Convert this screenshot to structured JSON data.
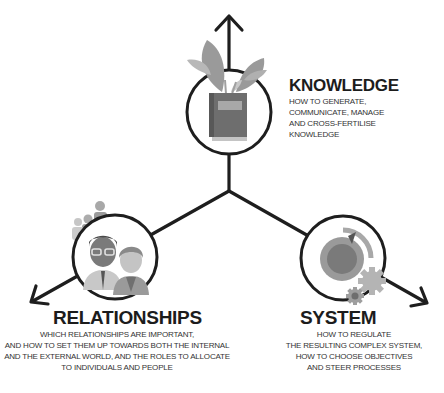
{
  "colors": {
    "line": "#1e1e1e",
    "leaf": "#9a9a9a",
    "book": "#6e6e6e",
    "people_dark": "#6a6a6a",
    "people_light": "#b4b4b4",
    "dial": "#7a7a7a",
    "gear": "#b0b0b0"
  },
  "nodes": [
    {
      "id": "knowledge",
      "icon": "book-with-plant-icon",
      "title": "KNOWLEDGE",
      "description": [
        "HOW TO GENERATE,",
        "COMMUNICATE, MANAGE",
        "AND CROSS-FERTILISE",
        "KNOWLEDGE"
      ]
    },
    {
      "id": "relationships",
      "icon": "people-group-icon",
      "title": "RELATIONSHIPS",
      "description": [
        "WHICH RELATIONSHIPS ARE IMPORTANT,",
        "AND HOW TO SET THEM UP TOWARDS BOTH THE INTERNAL",
        "AND THE EXTERNAL WORLD, AND THE ROLES TO ALLOCATE",
        "TO INDIVIDUALS AND PEOPLE"
      ]
    },
    {
      "id": "system",
      "icon": "dial-and-gears-icon",
      "title": "SYSTEM",
      "description": [
        "HOW TO REGULATE",
        "THE RESULTING COMPLEX SYSTEM,",
        "HOW TO CHOOSE OBJECTIVES",
        "AND STEER PROCESSES"
      ]
    }
  ]
}
